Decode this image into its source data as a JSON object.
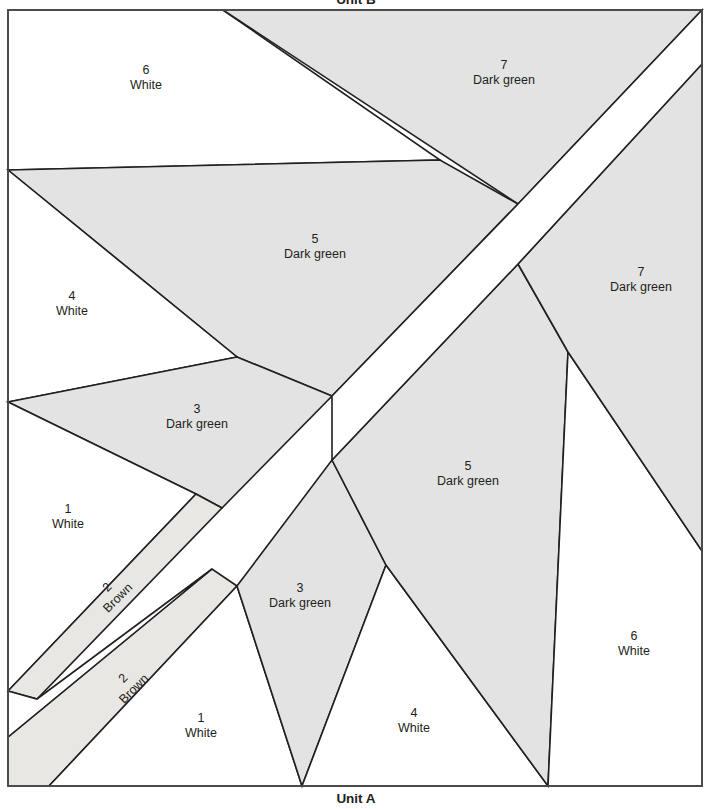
{
  "diagram": {
    "type": "paper-piecing-pattern",
    "width": 713,
    "height": 809,
    "top_unit_title": "Unit B",
    "bottom_unit_title": "Unit A",
    "colors": {
      "white_fabric": "#ffffff",
      "dark_green_fabric": "#e3e3e3",
      "brown_fabric": "#e9e7e4",
      "line": "#231f20",
      "frame": "#4c4c4c"
    },
    "fabric_names": {
      "white": "White",
      "dark_green": "Dark green",
      "brown": "Brown"
    },
    "pieces": [
      {
        "id": "b6",
        "unit": "B",
        "number": "6",
        "fabric": "White",
        "x": 146,
        "y": 74,
        "rot": 0
      },
      {
        "id": "b7",
        "unit": "B",
        "number": "7",
        "fabric": "Dark green",
        "x": 504,
        "y": 69,
        "rot": 0
      },
      {
        "id": "b5",
        "unit": "B",
        "number": "5",
        "fabric": "Dark green",
        "x": 315,
        "y": 243,
        "rot": 0
      },
      {
        "id": "b4",
        "unit": "B",
        "number": "4",
        "fabric": "White",
        "x": 72,
        "y": 300,
        "rot": 0
      },
      {
        "id": "b3",
        "unit": "B",
        "number": "3",
        "fabric": "Dark green",
        "x": 197,
        "y": 413,
        "rot": 0
      },
      {
        "id": "b1",
        "unit": "B",
        "number": "1",
        "fabric": "White",
        "x": 68,
        "y": 513,
        "rot": 0
      },
      {
        "id": "b2",
        "unit": "B",
        "number": "2",
        "fabric": "Brown",
        "x": 110,
        "y": 590,
        "rot": -45
      },
      {
        "id": "a2",
        "unit": "A",
        "number": "2",
        "fabric": "Brown",
        "x": 126,
        "y": 681,
        "rot": -45
      },
      {
        "id": "a1",
        "unit": "A",
        "number": "1",
        "fabric": "White",
        "x": 201,
        "y": 722,
        "rot": 0
      },
      {
        "id": "a3",
        "unit": "A",
        "number": "3",
        "fabric": "Dark green",
        "x": 300,
        "y": 592,
        "rot": 0
      },
      {
        "id": "a4",
        "unit": "A",
        "number": "4",
        "fabric": "White",
        "x": 414,
        "y": 717,
        "rot": 0
      },
      {
        "id": "a5",
        "unit": "A",
        "number": "5",
        "fabric": "Dark green",
        "x": 468,
        "y": 470,
        "rot": 0
      },
      {
        "id": "a6",
        "unit": "A",
        "number": "6",
        "fabric": "White",
        "x": 634,
        "y": 640,
        "rot": 0
      },
      {
        "id": "a7",
        "unit": "A",
        "number": "7",
        "fabric": "Dark green",
        "x": 641,
        "y": 276,
        "rot": 0
      }
    ]
  }
}
